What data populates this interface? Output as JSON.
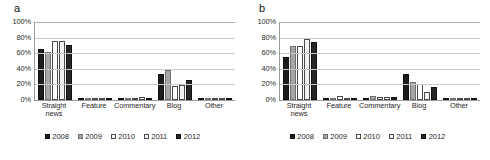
{
  "figure": {
    "panels": [
      {
        "label": "a",
        "key": "a"
      },
      {
        "label": "b",
        "key": "b"
      }
    ]
  },
  "axis": {
    "yticks": [
      "100%",
      "80%",
      "60%",
      "40%",
      "20%",
      "0%"
    ],
    "ytick_values": [
      100,
      80,
      60,
      40,
      20,
      0
    ]
  },
  "legend": {
    "items": [
      {
        "label": "2008",
        "series": "s2008",
        "color": "#1c1c1c"
      },
      {
        "label": "2009",
        "series": "s2009",
        "color": "#a6a6a6"
      },
      {
        "label": "2010",
        "series": "s2010",
        "color": "#ffffff"
      },
      {
        "label": "2011",
        "series": "s2011",
        "color": "#f2f2f2"
      },
      {
        "label": "2012",
        "series": "s2012",
        "color": "#262626"
      }
    ]
  },
  "chart_data": [
    {
      "type": "bar",
      "panel": "a",
      "title": "a",
      "xlabel": "",
      "ylabel": "",
      "ylim": [
        0,
        100
      ],
      "yticks": [
        0,
        20,
        40,
        60,
        80,
        100
      ],
      "grid": true,
      "legend_position": "bottom",
      "categories": [
        "Straight news",
        "Feature",
        "Commentary",
        "Blog",
        "Other"
      ],
      "series": [
        {
          "name": "2008",
          "values": [
            66,
            0,
            0,
            33,
            0
          ]
        },
        {
          "name": "2009",
          "values": [
            61,
            0,
            0,
            39,
            1
          ]
        },
        {
          "name": "2010",
          "values": [
            76,
            2,
            1,
            18,
            1
          ]
        },
        {
          "name": "2011",
          "values": [
            76,
            1,
            4,
            19,
            1
          ]
        },
        {
          "name": "2012",
          "values": [
            71,
            0,
            0,
            26,
            2
          ]
        }
      ]
    },
    {
      "type": "bar",
      "panel": "b",
      "title": "b",
      "xlabel": "",
      "ylabel": "",
      "ylim": [
        0,
        100
      ],
      "yticks": [
        0,
        20,
        40,
        60,
        80,
        100
      ],
      "grid": true,
      "legend_position": "bottom",
      "categories": [
        "Straight news",
        "Feature",
        "Commentary",
        "Blog",
        "Other"
      ],
      "series": [
        {
          "name": "2008",
          "values": [
            55,
            3,
            3,
            33,
            3
          ]
        },
        {
          "name": "2009",
          "values": [
            69,
            2,
            5,
            23,
            1
          ]
        },
        {
          "name": "2010",
          "values": [
            69,
            5,
            4,
            21,
            1
          ]
        },
        {
          "name": "2011",
          "values": [
            78,
            2,
            4,
            10,
            0
          ]
        },
        {
          "name": "2012",
          "values": [
            74,
            1,
            4,
            17,
            0
          ]
        }
      ]
    }
  ]
}
